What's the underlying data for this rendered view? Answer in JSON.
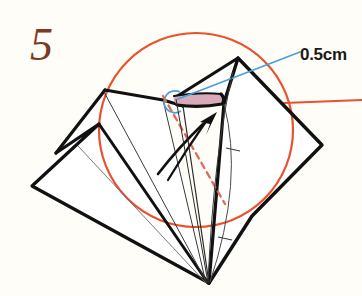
{
  "figure": {
    "kind": "origami-fold-diagram",
    "step_number": "5",
    "background_color": "#fffdf7",
    "measurement_label": "0.5cm",
    "colors": {
      "step_number": "#7a3b22",
      "zoom_circle": "#e8522c",
      "zoom_leader": "#e8522c",
      "dimension_leader": "#4a9fd8",
      "dimension_text": "#1a1a1a",
      "fold_crease_dashed": "#e06a5a",
      "paper_outline": "#111111",
      "paper_inner_line": "#3a3a3a",
      "paper_edge_fill": "#d9aab8",
      "angle_arc": "#4a9fd8",
      "paper_face": "#ffffff"
    },
    "annotations": {
      "zoom_circle": {
        "cx": 196,
        "cy": 130,
        "r": 97
      },
      "zoom_leader_line": {
        "x1": 284,
        "y1": 103,
        "x2": 362,
        "y2": 100
      },
      "dimension_leader_line": {
        "x1": 186,
        "y1": 95,
        "x2": 300,
        "y2": 52
      },
      "angle_arc_center": {
        "cx": 173,
        "cy": 101,
        "r": 11
      },
      "fold_dashed_line": {
        "x1": 164,
        "y1": 97,
        "x2": 224,
        "y2": 202
      },
      "rotation_arrow_tip": {
        "x": 217,
        "y": 114
      }
    },
    "shapes": {
      "left_back_panel": "32,186 105,90 163,100 209,283",
      "left_front_panel": "32,186 120,131 209,283",
      "right_panel": "238,58 322,145 252,215 209,283 224,103",
      "top_folded_flap": "163,100 238,58 224,100 183,106",
      "thin_edge_sliver": "174,97 222,95 224,102 176,104",
      "apex": "209,283"
    }
  }
}
